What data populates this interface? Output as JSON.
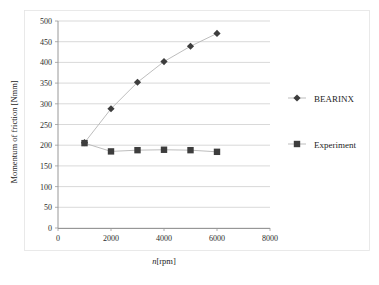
{
  "chart_data": {
    "type": "line",
    "title": "",
    "xlabel": "n[rpm]",
    "ylabel": "Momentum of friction [Nmm]",
    "xlim": [
      0,
      8000
    ],
    "ylim": [
      0,
      500
    ],
    "grid": true,
    "legend_position": "right",
    "x_ticks": [
      "0",
      "2000",
      "4000",
      "6000",
      "8000"
    ],
    "x_tick_values": [
      0,
      2000,
      4000,
      6000,
      8000
    ],
    "y_ticks": [
      "0",
      "50",
      "100",
      "150",
      "200",
      "250",
      "300",
      "350",
      "400",
      "450",
      "500"
    ],
    "y_tick_values": [
      0,
      50,
      100,
      150,
      200,
      250,
      300,
      350,
      400,
      450,
      500
    ],
    "x": [
      1000,
      2000,
      3000,
      4000,
      5000,
      6000
    ],
    "series": [
      {
        "name": "BEARINX",
        "marker": "diamond",
        "color": "#3d3d3d",
        "values": [
          206,
          288,
          352,
          402,
          439,
          470
        ]
      },
      {
        "name": "Experiment",
        "marker": "square",
        "color": "#3d3d3d",
        "values": [
          205,
          185,
          188,
          189,
          188,
          184
        ]
      }
    ]
  },
  "legend": {
    "items": [
      {
        "label": "BEARINX",
        "marker": "diamond"
      },
      {
        "label": "Experiment",
        "marker": "square"
      }
    ]
  },
  "colors": {
    "marker": "#3d3d3d",
    "line": "#b5b5b5",
    "grid": "#c9c9c9",
    "axis": "#8d8d8d",
    "text": "#1d1d1d",
    "background": "#ffffff"
  }
}
